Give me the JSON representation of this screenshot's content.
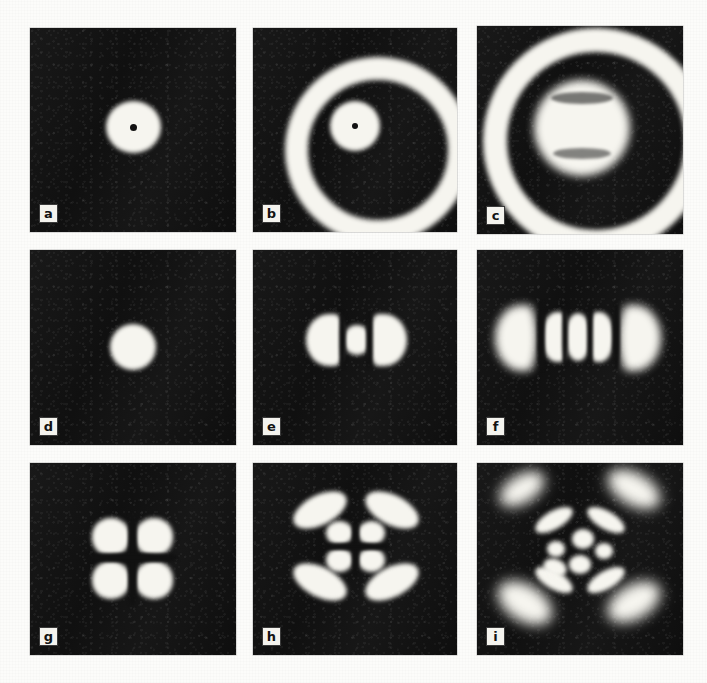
{
  "figure": {
    "kind": "photographic-plate-grid",
    "background_color": "#fcfcfa",
    "panel_background_color": "#141414",
    "lobe_color": "#f6f5ef",
    "rows": 3,
    "columns": 3,
    "panel_count": 9,
    "label_style": "boxed-lowercase-letter"
  },
  "panels": [
    {
      "label": "a",
      "row": 1,
      "column": 1,
      "description": "single bright central disk with a small dark point at its centre",
      "x": 30,
      "y": 28,
      "width": 206,
      "height": 204
    },
    {
      "label": "b",
      "row": 1,
      "column": 2,
      "description": "bright central disk with dark point, dark annular gap, bright outer ring",
      "x": 253,
      "y": 28,
      "width": 204,
      "height": 204
    },
    {
      "label": "c",
      "row": 1,
      "column": 3,
      "description": "large bright inner disk with faint texture, broad dark ring, bright outer annulus filling the frame",
      "x": 477,
      "y": 26,
      "width": 206,
      "height": 208
    },
    {
      "label": "d",
      "row": 2,
      "column": 1,
      "description": "single bright round spot, fundamental Gaussian-like mode",
      "x": 30,
      "y": 250,
      "width": 206,
      "height": 195
    },
    {
      "label": "e",
      "row": 2,
      "column": 2,
      "description": "three horizontal lobes: two crescent side lobes flanking a round central lobe",
      "x": 253,
      "y": 250,
      "width": 204,
      "height": 195
    },
    {
      "label": "f",
      "row": 2,
      "column": 3,
      "description": "five horizontal lobes: two large diffuse outer lobes and three tighter inner lobes",
      "x": 477,
      "y": 250,
      "width": 206,
      "height": 195
    },
    {
      "label": "g",
      "row": 3,
      "column": 1,
      "description": "four bright round lobes in a two-by-two square arrangement",
      "x": 30,
      "y": 463,
      "width": 206,
      "height": 192
    },
    {
      "label": "h",
      "row": 3,
      "column": 2,
      "description": "four small inner lobes surrounded by four curved outer crescent arcs",
      "x": 253,
      "y": 463,
      "width": 204,
      "height": 192
    },
    {
      "label": "i",
      "row": 3,
      "column": 3,
      "description": "three nested rings of lobes: four diffuse diagonal outer blobs, four elongated mid lobes, small inner cluster",
      "x": 477,
      "y": 463,
      "width": 206,
      "height": 192
    }
  ]
}
